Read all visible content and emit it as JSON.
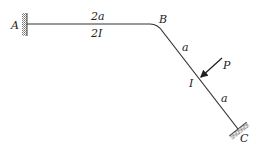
{
  "diagram": {
    "type": "structural-frame",
    "colors": {
      "line": "#333333",
      "hatch": "#777777",
      "text": "#222222",
      "background": "#ffffff"
    },
    "labels": {
      "A": "A",
      "B": "B",
      "C": "C",
      "P": "P",
      "AB_length": "2a",
      "AB_inertia": "2I",
      "BC_upper_length": "a",
      "BC_inertia": "I",
      "BC_lower_length": "a"
    },
    "supports": [
      {
        "node": "A",
        "type": "fixed"
      },
      {
        "node": "C",
        "type": "fixed"
      }
    ],
    "members": [
      {
        "from": "A",
        "to": "B",
        "length": "2a",
        "inertia": "2I"
      },
      {
        "from": "B",
        "to": "C",
        "length": "2a",
        "inertia": "I"
      }
    ],
    "loads": [
      {
        "name": "P",
        "type": "point-force",
        "location": "midpoint of BC",
        "direction": "perpendicular to BC, toward member"
      }
    ]
  }
}
